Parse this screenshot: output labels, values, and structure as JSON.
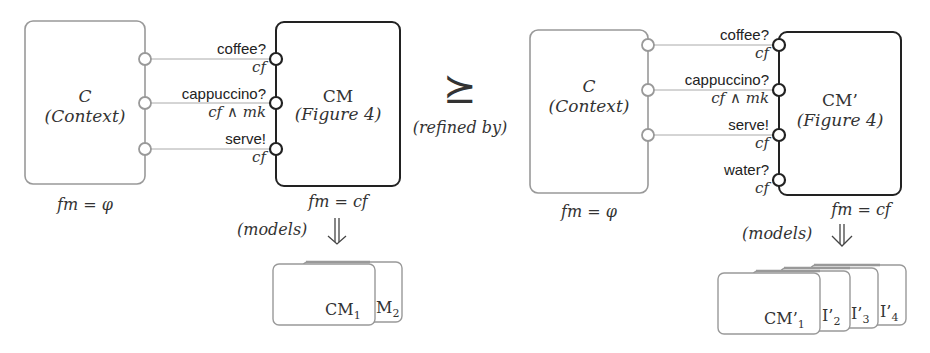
{
  "left": {
    "context": {
      "name": "C",
      "subtitle": "(Context)",
      "fm": "fm = φ"
    },
    "component": {
      "name": "CM",
      "subtitle": "(Figure 4)",
      "fm": "fm = cf"
    },
    "ports": [
      {
        "label": "coffee?",
        "guard": "cf"
      },
      {
        "label": "cappuccino?",
        "guard": "cf ∧ mk"
      },
      {
        "label": "serve!",
        "guard": "cf"
      }
    ],
    "models_label": "(models)",
    "products": [
      {
        "label": "CM",
        "sub": "1"
      },
      {
        "label": "M",
        "sub": "2"
      }
    ]
  },
  "relation": {
    "symbol": "⪰",
    "label": "(refined by)"
  },
  "right": {
    "context": {
      "name": "C",
      "subtitle": "(Context)",
      "fm": "fm = φ"
    },
    "component": {
      "name": "CM’",
      "subtitle": "(Figure 4)",
      "fm": "fm = cf"
    },
    "ports": [
      {
        "label": "coffee?",
        "guard": "cf"
      },
      {
        "label": "cappuccino?",
        "guard": "cf ∧ mk"
      },
      {
        "label": "serve!",
        "guard": "cf"
      },
      {
        "label": "water?",
        "guard": "cf"
      }
    ],
    "models_label": "(models)",
    "products": [
      {
        "label": "CM’",
        "sub": "1"
      },
      {
        "label": "I’",
        "sub": "2"
      },
      {
        "label": "I’",
        "sub": "3"
      },
      {
        "label": "I’",
        "sub": "4"
      }
    ]
  }
}
